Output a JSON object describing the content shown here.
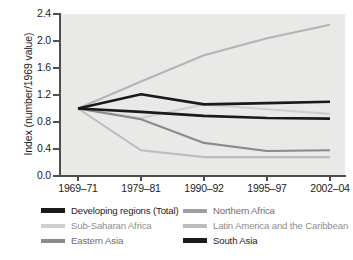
{
  "chart_data": {
    "type": "line",
    "title": "",
    "xlabel": "",
    "ylabel": "Index (number/1969 value)",
    "ylim": [
      0.0,
      2.4
    ],
    "yticks": [
      "0.0",
      "0.4",
      "0.8",
      "1.2",
      "1.6",
      "2.0",
      "2.4"
    ],
    "grid": false,
    "legend_position": "below",
    "categories": [
      "1969–71",
      "1979–81",
      "1990–92",
      "1995–97",
      "2002–04"
    ],
    "series": [
      {
        "name": "Developing regions (Total)",
        "color": "#1a1a1a",
        "values": [
          1.0,
          1.21,
          1.06,
          1.08,
          1.1
        ]
      },
      {
        "name": "Northern Africa",
        "color": "#b4b4b4",
        "values": [
          1.0,
          1.4,
          1.79,
          2.04,
          2.24
        ]
      },
      {
        "name": "Sub-Saharan Africa",
        "color": "#cfcfcf",
        "values": [
          1.0,
          0.86,
          1.06,
          0.99,
          0.92
        ]
      },
      {
        "name": "Latin America and the Caribbean",
        "color": "#bdbdbd",
        "values": [
          1.0,
          0.38,
          0.28,
          0.28,
          0.28
        ]
      },
      {
        "name": "Eastern Asia",
        "color": "#8a8a8a",
        "values": [
          1.0,
          0.84,
          0.49,
          0.37,
          0.38
        ]
      },
      {
        "name": "South Asia",
        "color": "#1a1a1a",
        "values": [
          1.0,
          0.95,
          0.89,
          0.86,
          0.85
        ]
      }
    ]
  },
  "legend": {
    "rows": [
      [
        {
          "label": "Developing regions (Total)",
          "color": "#1a1a1a",
          "tone": "dark",
          "thick": true
        },
        {
          "label": "Northern Africa",
          "color": "#9f9f9f",
          "tone": "mid",
          "thick": false
        }
      ],
      [
        {
          "label": "Sub-Saharan Africa",
          "color": "#cfcfcf",
          "tone": "faint",
          "thick": false
        },
        {
          "label": "Latin America and the Caribbean",
          "color": "#bdbdbd",
          "tone": "faint",
          "thick": false
        }
      ],
      [
        {
          "label": "Eastern Asia",
          "color": "#8a8a8a",
          "tone": "mid",
          "thick": false
        },
        {
          "label": "South Asia",
          "color": "#1a1a1a",
          "tone": "dark",
          "thick": true
        }
      ]
    ]
  },
  "plot_style": {
    "plot_background": "#e9e9e7",
    "axis_color": "#4e4e4e",
    "text_color": "#1d1d1d"
  }
}
